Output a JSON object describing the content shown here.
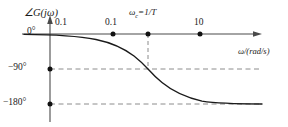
{
  "figure": {
    "title_present": false,
    "axis": {
      "y_axis_label": "∠G(jω)",
      "x_axis_label": "ω/(rad/s)"
    },
    "y_ticks": [
      {
        "label": "0°",
        "value": 0
      },
      {
        "label": "−90°",
        "value": -90
      },
      {
        "label": "−180°",
        "value": -180
      }
    ],
    "x_ticks": [
      {
        "label": "0.1",
        "marker": false
      },
      {
        "label": "0.1",
        "marker": true
      },
      {
        "label": "ωc=1/T",
        "marker": true
      },
      {
        "label": "10",
        "marker": true
      }
    ],
    "colors": {
      "curve": "#1a1a1a",
      "axis": "#4a4a4a",
      "dashed": "#8c8c8c",
      "marker": "#111111",
      "background": "#ffffff"
    }
  },
  "chart_data": {
    "type": "line",
    "title": "",
    "xlabel": "ω/(rad/s)",
    "ylabel": "∠G(jω)",
    "xscale": "log",
    "grid": false,
    "legend": null,
    "ylim": [
      -180,
      0
    ],
    "ytick_values": [
      0,
      -90,
      -180
    ],
    "ytick_labels": [
      "0°",
      "−90°",
      "−180°"
    ],
    "xtick_labels": [
      "0.1",
      "0.1",
      "ωc=1/T",
      "10"
    ],
    "annotations": [
      {
        "text": "ωc=1/T",
        "at_phase": -90,
        "note": "corner frequency, curve crosses −90°"
      }
    ],
    "dashed_reference_lines": [
      -90,
      -180
    ],
    "series": [
      {
        "name": "phase",
        "x": [
          0.002,
          0.01,
          0.03,
          0.06,
          0.1,
          0.2,
          0.3,
          0.5,
          0.7,
          1.0,
          1.4,
          2.0,
          3.0,
          5.0,
          8.0,
          15.0,
          30.0,
          60.0,
          100.0
        ],
        "values": [
          -0.4,
          -1.5,
          -4,
          -8,
          -13,
          -25,
          -36,
          -55,
          -70,
          -90,
          -110,
          -128,
          -145,
          -160,
          -168,
          -173,
          -177,
          -179,
          -180
        ]
      }
    ]
  }
}
